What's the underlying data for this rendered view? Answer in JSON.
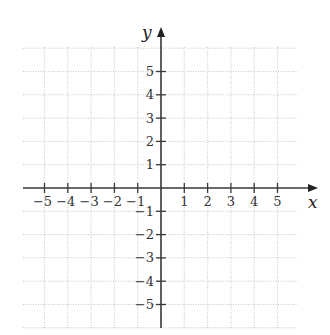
{
  "chart_data": {
    "type": "scatter",
    "title": "",
    "xlabel": "x",
    "ylabel": "y",
    "xlim": [
      -6,
      6
    ],
    "ylim": [
      -6,
      6
    ],
    "grid": true,
    "x_ticks": [
      -5,
      -4,
      -3,
      -2,
      -1,
      1,
      2,
      3,
      4,
      5
    ],
    "y_ticks": [
      5,
      4,
      3,
      2,
      1,
      -1,
      -2,
      -3,
      -4,
      -5
    ],
    "x_tick_labels": [
      "−5",
      "−4",
      "−3",
      "−2",
      "−1",
      "1",
      "2",
      "3",
      "4",
      "5"
    ],
    "y_tick_labels": [
      "5",
      "4",
      "3",
      "2",
      "1",
      "−1",
      "−2",
      "−3",
      "−4",
      "−5"
    ],
    "series": [],
    "legend": null
  },
  "layout": {
    "origin_x": 161,
    "origin_y": 188,
    "unit": 23.3,
    "grid_left": 23,
    "grid_right": 298,
    "grid_top": 47,
    "grid_bottom": 328,
    "axis_color": "#3a3a3a",
    "grid_color": "#b8b8b8"
  }
}
